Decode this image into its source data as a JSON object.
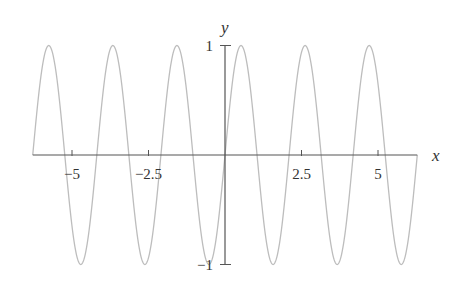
{
  "chart_data": {
    "type": "line",
    "title": "",
    "function": "sin(3x)",
    "xlabel": "x",
    "ylabel": "y",
    "xlim": [
      -6.2832,
      6.2832
    ],
    "ylim": [
      -1,
      1
    ],
    "grid": false,
    "legend": null,
    "x_ticks": [
      {
        "value": -5,
        "label": "−5"
      },
      {
        "value": -2.5,
        "label": "−2.5"
      },
      {
        "value": 2.5,
        "label": "2.5"
      },
      {
        "value": 5,
        "label": "5"
      }
    ],
    "y_ticks": [
      {
        "value": 1,
        "label": "1"
      },
      {
        "value": -1,
        "label": "−1"
      }
    ],
    "series": [
      {
        "name": "y = sin(3x)",
        "color": "#bdbdbd",
        "samples": 600,
        "x": [
          -6.2832,
          -5.7596,
          -5.236,
          -4.7124,
          -4.1888,
          -3.6652,
          -3.1416,
          -2.618,
          -2.0944,
          -1.5708,
          -1.0472,
          -0.5236,
          0,
          0.5236,
          1.0472,
          1.5708,
          2.0944,
          2.618,
          3.1416,
          3.6652,
          4.1888,
          4.7124,
          5.236,
          5.7596,
          6.2832
        ],
        "y": [
          0,
          1,
          0,
          -1,
          0,
          1,
          0,
          -1,
          0,
          1,
          0,
          -1,
          0,
          1,
          0,
          -1,
          0,
          1,
          0,
          -1,
          0,
          1,
          0,
          -1,
          0
        ]
      }
    ]
  },
  "colors": {
    "axis": "#555555",
    "curve": "#bdbdbd",
    "text": "#333333"
  }
}
